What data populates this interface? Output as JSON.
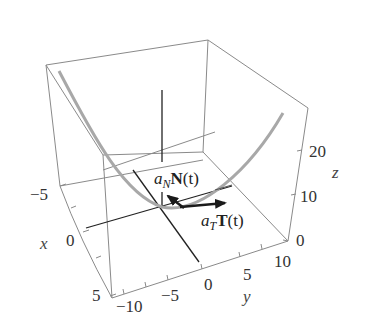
{
  "figure": {
    "type": "3d-curve-plot",
    "labels": {
      "normal_vector": {
        "coef": "a",
        "sub": "N",
        "vec": "N",
        "arg": "(t)"
      },
      "tangent_vector": {
        "coef": "a",
        "sub": "T",
        "vec": "T",
        "arg": "(t)"
      }
    },
    "axes": {
      "x": {
        "name": "x",
        "ticks": [
          "−5",
          "0",
          "5"
        ]
      },
      "y": {
        "name": "y",
        "ticks": [
          "−10",
          "−5",
          "0",
          "5",
          "10"
        ]
      },
      "z": {
        "name": "z",
        "ticks": [
          "0",
          "10",
          "20"
        ]
      }
    },
    "colors": {
      "box": "#8a8a8a",
      "axes": "#222222",
      "curve": "#a0a0a0",
      "vectors": "#1a1a1a"
    }
  }
}
